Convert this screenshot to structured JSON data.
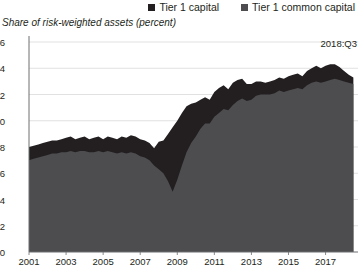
{
  "legend": {
    "items": [
      {
        "label": "Tier 1 capital",
        "color": "#231f20",
        "swatch_name": "legend-swatch-tier1-capital"
      },
      {
        "label": "Tier 1 common capital",
        "color": "#4d4d4f",
        "swatch_name": "legend-swatch-tier1-common-capital"
      }
    ]
  },
  "subtitle": "Share of risk-weighted assets (percent)",
  "annotation": "2018:Q3",
  "chart_data": {
    "type": "area",
    "title": "",
    "subtitle": "Share of risk-weighted assets (percent)",
    "xlabel": "",
    "ylabel": "Share of risk-weighted assets (percent)",
    "stacked": false,
    "grid": true,
    "legend_position": "top-right",
    "annotations": [
      {
        "text": "2018:Q3",
        "x": "2018.5",
        "y": 15.0
      }
    ],
    "xlim": [
      2001.0,
      2018.75
    ],
    "ylim": [
      0,
      16
    ],
    "yticks": [
      0,
      2,
      4,
      6,
      8,
      10,
      12,
      14,
      16
    ],
    "xticks": [
      2001,
      2003,
      2005,
      2007,
      2009,
      2011,
      2013,
      2015,
      2017
    ],
    "x": [
      2001.0,
      2001.25,
      2001.5,
      2001.75,
      2002.0,
      2002.25,
      2002.5,
      2002.75,
      2003.0,
      2003.25,
      2003.5,
      2003.75,
      2004.0,
      2004.25,
      2004.5,
      2004.75,
      2005.0,
      2005.25,
      2005.5,
      2005.75,
      2006.0,
      2006.25,
      2006.5,
      2006.75,
      2007.0,
      2007.25,
      2007.5,
      2007.75,
      2008.0,
      2008.25,
      2008.5,
      2008.75,
      2009.0,
      2009.25,
      2009.5,
      2009.75,
      2010.0,
      2010.25,
      2010.5,
      2010.75,
      2011.0,
      2011.25,
      2011.5,
      2011.75,
      2012.0,
      2012.25,
      2012.5,
      2012.75,
      2013.0,
      2013.25,
      2013.5,
      2013.75,
      2014.0,
      2014.25,
      2014.5,
      2014.75,
      2015.0,
      2015.25,
      2015.5,
      2015.75,
      2016.0,
      2016.25,
      2016.5,
      2016.75,
      2017.0,
      2017.25,
      2017.5,
      2017.75,
      2018.0,
      2018.25,
      2018.5
    ],
    "series": [
      {
        "name": "Tier 1 capital",
        "color": "#231f20",
        "values": [
          8.0,
          8.1,
          8.2,
          8.3,
          8.4,
          8.5,
          8.5,
          8.6,
          8.7,
          8.8,
          8.6,
          8.7,
          8.8,
          8.6,
          8.7,
          8.8,
          8.6,
          8.8,
          8.7,
          8.6,
          8.8,
          8.7,
          8.9,
          8.8,
          8.6,
          8.5,
          8.3,
          7.9,
          8.4,
          8.5,
          9.0,
          9.5,
          10.0,
          10.6,
          11.1,
          11.3,
          11.4,
          11.6,
          11.8,
          11.6,
          12.2,
          12.5,
          12.7,
          12.4,
          12.9,
          13.1,
          13.2,
          12.8,
          12.8,
          13.0,
          13.0,
          12.9,
          13.0,
          13.1,
          13.3,
          13.2,
          13.4,
          13.5,
          13.6,
          13.4,
          13.8,
          14.0,
          14.2,
          14.0,
          14.2,
          14.3,
          14.3,
          14.1,
          13.8,
          13.5,
          13.3
        ]
      },
      {
        "name": "Tier 1 common capital",
        "color": "#4d4d4f",
        "values": [
          7.0,
          7.1,
          7.2,
          7.3,
          7.4,
          7.5,
          7.5,
          7.6,
          7.6,
          7.7,
          7.6,
          7.7,
          7.7,
          7.6,
          7.6,
          7.7,
          7.6,
          7.7,
          7.6,
          7.5,
          7.6,
          7.5,
          7.6,
          7.5,
          7.3,
          7.2,
          7.0,
          6.6,
          6.3,
          6.0,
          5.4,
          4.6,
          5.5,
          6.6,
          7.6,
          8.3,
          8.8,
          9.4,
          9.8,
          9.8,
          10.3,
          10.6,
          10.9,
          10.8,
          11.2,
          11.5,
          11.7,
          11.5,
          11.6,
          11.9,
          12.0,
          12.0,
          12.0,
          12.1,
          12.3,
          12.2,
          12.3,
          12.4,
          12.5,
          12.4,
          12.7,
          12.9,
          13.0,
          12.9,
          13.0,
          13.1,
          13.2,
          13.1,
          13.0,
          12.9,
          12.8
        ]
      }
    ]
  }
}
